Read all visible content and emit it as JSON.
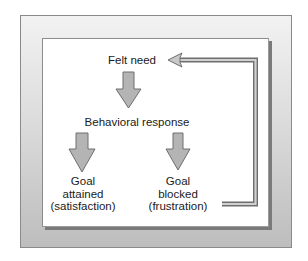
{
  "diagram": {
    "type": "flow-diagram",
    "nodes": {
      "felt_need": {
        "label": "Felt need"
      },
      "behavioral_response": {
        "label": "Behavioral response"
      },
      "goal_attained": {
        "line1": "Goal",
        "line2": "attained",
        "line3": "(satisfaction)"
      },
      "goal_blocked": {
        "line1": "Goal",
        "line2": "blocked",
        "line3": "(frustration)"
      }
    },
    "edges": [
      {
        "from": "felt_need",
        "to": "behavioral_response",
        "style": "block-arrow-down"
      },
      {
        "from": "behavioral_response",
        "to": "goal_attained",
        "style": "block-arrow-down"
      },
      {
        "from": "behavioral_response",
        "to": "goal_blocked",
        "style": "block-arrow-down"
      },
      {
        "from": "goal_blocked",
        "to": "felt_need",
        "style": "feedback-loop-arrow"
      }
    ],
    "colors": {
      "arrow_fill": "#b4b4b4",
      "arrow_stroke": "#6e6e6e",
      "frame_top": "#f2f2f2",
      "frame_bottom": "#bdbdbd",
      "inner_bg": "#ffffff",
      "text": "#1a1a1a"
    }
  }
}
